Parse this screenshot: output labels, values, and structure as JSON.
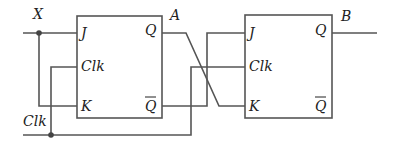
{
  "diagram": {
    "inputs": {
      "x_label": "X",
      "clk_label": "Clk"
    },
    "outputs": {
      "a_label": "A",
      "b_label": "B"
    },
    "flipflop1": {
      "j": "J",
      "clk": "Clk",
      "k": "K",
      "q": "Q",
      "qbar": "Q"
    },
    "flipflop2": {
      "j": "J",
      "clk": "Clk",
      "k": "K",
      "q": "Q",
      "qbar": "Q"
    },
    "colors": {
      "wire": "#555555",
      "text": "#222222"
    }
  }
}
